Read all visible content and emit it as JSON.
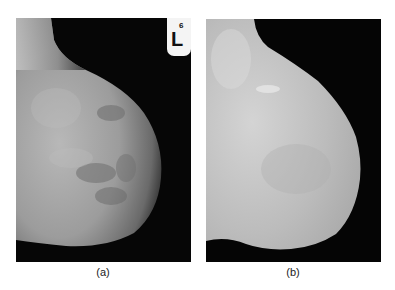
{
  "figure": {
    "panels": [
      {
        "id": "a",
        "caption": "(a)",
        "description": "Original mammogram (mediolateral view) with label marker",
        "marker": {
          "number": "6",
          "letter": "L"
        }
      },
      {
        "id": "b",
        "caption": "(b)",
        "description": "Segmented breast region with background and label removed"
      }
    ]
  }
}
